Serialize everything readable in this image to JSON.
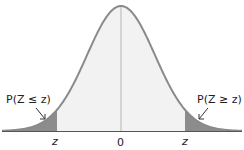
{
  "diagram": {
    "center_label": "0",
    "left_tick_label": "z",
    "right_tick_label": "z",
    "left_tail_label": "P(Z ≤ z)",
    "right_tail_label": "P(Z ≥ z)",
    "colors": {
      "curve": "#8a8a8a",
      "body_fill": "#f2f2f2",
      "tail_fill": "#8c8c8c",
      "axis": "#555555",
      "center_line": "#b0b0b0"
    }
  }
}
